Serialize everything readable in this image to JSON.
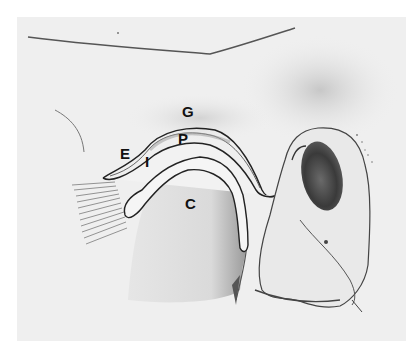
{
  "figure": {
    "background_color": "#efefef",
    "labels": [
      {
        "id": "G",
        "text": "G",
        "x": 182,
        "y": 104
      },
      {
        "id": "P",
        "text": "P",
        "x": 178,
        "y": 131
      },
      {
        "id": "E",
        "text": "E",
        "x": 120,
        "y": 146
      },
      {
        "id": "I",
        "text": "I",
        "x": 145,
        "y": 154
      },
      {
        "id": "C",
        "text": "C",
        "x": 185,
        "y": 196
      }
    ]
  }
}
